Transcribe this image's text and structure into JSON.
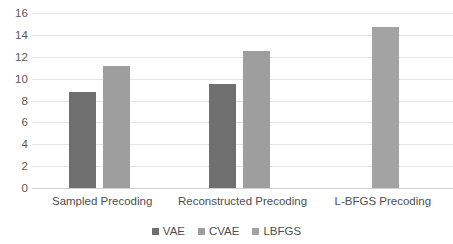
{
  "chart_data": {
    "type": "bar",
    "title": "",
    "xlabel": "",
    "ylabel": "",
    "categories": [
      "Sampled Precoding",
      "Reconstructed Precoding",
      "L-BFGS Precoding"
    ],
    "series": [
      {
        "name": "VAE",
        "color": "#6f6f6f",
        "values": [
          8.8,
          9.5,
          null
        ]
      },
      {
        "name": "CVAE",
        "color": "#9e9e9e",
        "values": [
          11.2,
          12.5,
          null
        ]
      },
      {
        "name": "LBFGS",
        "color": "#a3a3a3",
        "values": [
          null,
          null,
          14.7
        ]
      }
    ],
    "ylim": [
      0,
      16
    ],
    "ytick_labels": [
      "0",
      "2",
      "4",
      "6",
      "8",
      "10",
      "12",
      "14",
      "16"
    ],
    "ytick_values": [
      0,
      2,
      4,
      6,
      8,
      10,
      12,
      14,
      16
    ],
    "grid": true,
    "legend_position": "bottom",
    "legend_entries": [
      "VAE",
      "CVAE",
      "LBFGS"
    ],
    "colors": {
      "vae": "#6f6f6f",
      "cvae": "#9e9e9e",
      "lbfgs": "#a3a3a3",
      "gridline": "#e3e3e3",
      "baseline": "#d0d0d0",
      "text": "#4f4f4f",
      "background": "#ffffff"
    }
  }
}
